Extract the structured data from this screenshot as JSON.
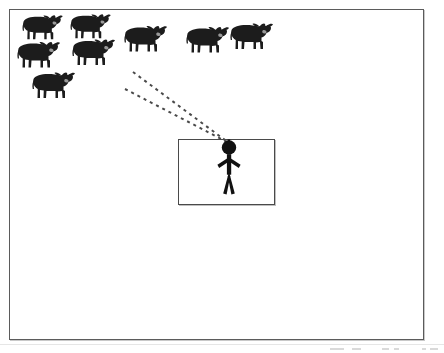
{
  "figure": {
    "background_color": "#ffffff",
    "frame": {
      "name": "outer-frame",
      "x": 9,
      "y": 9,
      "width": 415,
      "height": 331,
      "border_color": "#5b5b5b",
      "border_width": 1
    },
    "pen": {
      "name": "handler-pen-rectangle",
      "x": 178,
      "y": 139,
      "width": 97,
      "height": 66,
      "border_color": "#4a4a4a",
      "border_width": 1
    },
    "handler": {
      "name": "handler-stick-figure",
      "x": 214,
      "y": 139,
      "width": 30,
      "height": 56,
      "color": "#111111"
    },
    "herd": {
      "name": "cattle-herd",
      "count": 7,
      "color": "#1c1c1c",
      "animals": [
        {
          "id": "cow-1",
          "x": 18,
          "y": 12,
          "width": 46,
          "height": 33,
          "flip": false
        },
        {
          "id": "cow-2",
          "x": 66,
          "y": 11,
          "width": 46,
          "height": 33,
          "flip": false
        },
        {
          "id": "cow-3",
          "x": 14,
          "y": 38,
          "width": 46,
          "height": 36,
          "flip": false
        },
        {
          "id": "cow-4",
          "x": 69,
          "y": 35,
          "width": 46,
          "height": 37,
          "flip": false
        },
        {
          "id": "cow-5",
          "x": 29,
          "y": 68,
          "width": 46,
          "height": 37,
          "flip": false
        },
        {
          "id": "cow-6",
          "x": 121,
          "y": 22,
          "width": 46,
          "height": 36,
          "flip": false
        },
        {
          "id": "cow-7",
          "x": 183,
          "y": 23,
          "width": 46,
          "height": 36,
          "flip": false
        },
        {
          "id": "cow-8",
          "x": 227,
          "y": 19,
          "width": 46,
          "height": 37,
          "flip": false
        }
      ]
    },
    "sight_lines": {
      "name": "dashed-sight-lines",
      "color": "#4a4a4a",
      "dash_pattern": "3 4",
      "stroke_width": 2,
      "converge_point": {
        "x": 229,
        "y": 143
      },
      "lines": [
        {
          "id": "sight-line-upper",
          "x1": 133,
          "y1": 72,
          "x2": 229,
          "y2": 143
        },
        {
          "id": "sight-line-lower",
          "x1": 125,
          "y1": 89,
          "x2": 229,
          "y2": 143
        }
      ]
    },
    "scan_artifacts": {
      "name": "scanner-edge-marks",
      "baseline_y": 344,
      "marks": [
        {
          "x": 0,
          "w": 14
        },
        {
          "x": 22,
          "w": 9
        },
        {
          "x": 52,
          "w": 7
        },
        {
          "x": 64,
          "w": 5
        },
        {
          "x": 92,
          "w": 4
        },
        {
          "x": 100,
          "w": 8
        }
      ]
    }
  }
}
